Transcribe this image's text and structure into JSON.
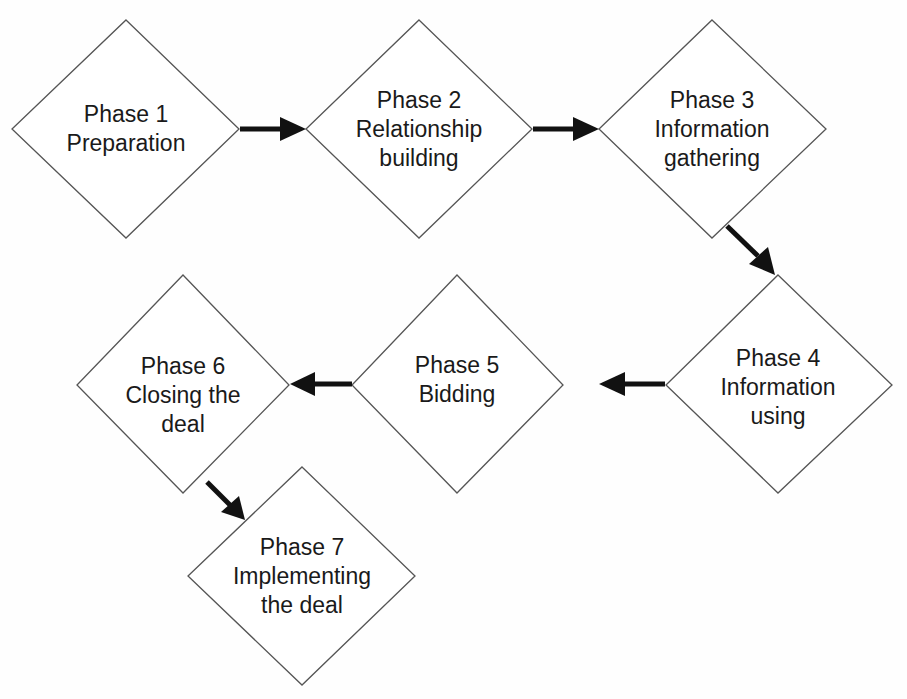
{
  "diagram": {
    "type": "flowchart",
    "colors": {
      "stroke": "#555555",
      "arrow": "#111111",
      "fill": "#ffffff",
      "text": "#1a1a1a"
    },
    "nodes": [
      {
        "id": "phase1",
        "shape": "diamond",
        "lines": [
          "Phase 1",
          "Preparation"
        ]
      },
      {
        "id": "phase2",
        "shape": "diamond",
        "lines": [
          "Phase 2",
          "Relationship",
          "building"
        ]
      },
      {
        "id": "phase3",
        "shape": "diamond",
        "lines": [
          "Phase 3",
          "Information",
          "gathering"
        ]
      },
      {
        "id": "phase4",
        "shape": "diamond",
        "lines": [
          "Phase 4",
          "Information",
          "using"
        ]
      },
      {
        "id": "phase5",
        "shape": "diamond",
        "lines": [
          "Phase 5",
          "Bidding"
        ]
      },
      {
        "id": "phase6",
        "shape": "diamond",
        "lines": [
          "Phase 6",
          "Closing the",
          "deal"
        ]
      },
      {
        "id": "phase7",
        "shape": "diamond",
        "lines": [
          "Phase 7",
          "Implementing",
          "the deal"
        ]
      }
    ],
    "edges": [
      {
        "from": "phase1",
        "to": "phase2",
        "direction": "right"
      },
      {
        "from": "phase2",
        "to": "phase3",
        "direction": "right"
      },
      {
        "from": "phase3",
        "to": "phase4",
        "direction": "down-right"
      },
      {
        "from": "phase4",
        "to": "phase5",
        "direction": "left"
      },
      {
        "from": "phase5",
        "to": "phase6",
        "direction": "left"
      },
      {
        "from": "phase6",
        "to": "phase7",
        "direction": "down-right"
      }
    ]
  }
}
